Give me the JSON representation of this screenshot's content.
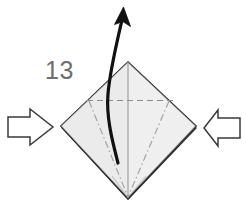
{
  "diagram": {
    "type": "origami-fold-instruction",
    "step_number": "13",
    "title_visible": false,
    "background_color": "#ffffff",
    "paper": {
      "name": "folded-paper-diamond",
      "shape": "diamond",
      "fill_color": "#efefef",
      "edge_color": "#1a1a1a",
      "vertices": {
        "top": [
          128,
          62
        ],
        "right": [
          196,
          126
        ],
        "bottom": [
          128,
          198
        ],
        "left": [
          61,
          126
        ]
      },
      "crease_lines": [
        {
          "name": "vertical-center-crease",
          "style": "solid",
          "color": "#9a9a9a",
          "from": [
            128,
            62
          ],
          "to": [
            128,
            198
          ]
        },
        {
          "name": "horizontal-valley-fold",
          "style": "dashed",
          "color": "#8c8c8c",
          "from": [
            88,
            100
          ],
          "to": [
            174,
            100
          ]
        },
        {
          "name": "left-mountain-fold",
          "style": "dash-dot",
          "color": "#9a9a9a",
          "from": [
            90,
            102
          ],
          "to": [
            128,
            198
          ]
        },
        {
          "name": "right-mountain-fold",
          "style": "dash-dot",
          "color": "#9a9a9a",
          "from": [
            168,
            102
          ],
          "to": [
            128,
            198
          ]
        }
      ]
    },
    "curved_arrow": {
      "name": "pull-up-curved-arrow",
      "color": "#111111",
      "direction": "up",
      "tail": [
        118,
        163
      ],
      "head": [
        123,
        9
      ],
      "description": "curved arrow indicating the flap is pulled upward"
    },
    "push_arrows": [
      {
        "name": "left-push-arrow",
        "direction": "right",
        "fill_color": "#ffffff",
        "stroke_color": "#3a3a3a",
        "tip": [
          53,
          127
        ]
      },
      {
        "name": "right-push-arrow",
        "direction": "left",
        "fill_color": "#ffffff",
        "stroke_color": "#3a3a3a",
        "tip": [
          204,
          128
        ]
      }
    ],
    "step_label": {
      "name": "step-number",
      "value": "13",
      "color": "#6e6e6e",
      "position": [
        45,
        78
      ]
    }
  }
}
